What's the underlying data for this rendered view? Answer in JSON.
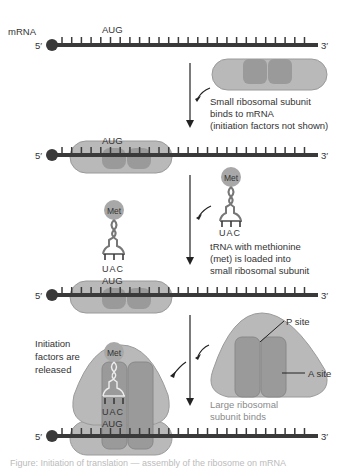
{
  "labels": {
    "mrna": "mRNA",
    "five_prime": "5′",
    "three_prime": "3′",
    "aug": "AUG",
    "uac": "UAC",
    "met": "Met"
  },
  "steps": [
    {
      "line1": "Small ribosomal subunit",
      "line2": "binds to mRNA",
      "line3": "(initiation factors not shown)"
    },
    {
      "line1": "tRNA with methionine",
      "line2": "(met) is loaded into",
      "line3": "small ribosomal subunit"
    },
    {
      "line1": "Large ribosomal",
      "line2": "subunit binds"
    }
  ],
  "annotations": {
    "initiation_1": "Initiation",
    "initiation_2": "factors are",
    "initiation_3": "released",
    "p_site": "P site",
    "a_site": "A site"
  },
  "caption": "Figure: Initiation of translation — assembly of the ribosome on mRNA",
  "colors": {
    "strand": "#3a3a3a",
    "subunit_light": "#b9b9b9",
    "subunit_dark": "#9a9a9a",
    "met": "#a8a8a8",
    "label_gray": "#8a8a8a"
  }
}
